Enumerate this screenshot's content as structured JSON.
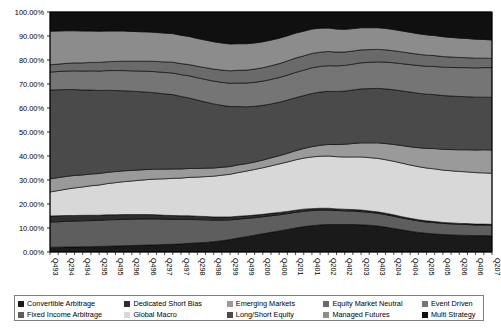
{
  "chart_data": {
    "type": "area",
    "stacked": true,
    "normalized_percent": true,
    "title": "",
    "xlabel": "",
    "ylabel": "",
    "ylim": [
      0,
      100
    ],
    "ytick_labels": [
      "0.00%",
      "10.00%",
      "20.00%",
      "30.00%",
      "40.00%",
      "50.00%",
      "60.00%",
      "70.00%",
      "80.00%",
      "90.00%",
      "100.00%"
    ],
    "ytick_values": [
      0,
      10,
      20,
      30,
      40,
      50,
      60,
      70,
      80,
      90,
      100
    ],
    "grid": false,
    "legend_position": "bottom",
    "x_tick_labels": [
      "Q493",
      "Q294",
      "Q494",
      "Q295",
      "Q495",
      "Q296",
      "Q496",
      "Q297",
      "Q497",
      "Q298",
      "Q498",
      "Q299",
      "Q499",
      "Q200",
      "Q400",
      "Q201",
      "Q401",
      "Q202",
      "Q402",
      "Q203",
      "Q403",
      "Q204",
      "Q404",
      "Q205",
      "Q405",
      "Q206",
      "Q406",
      "Q207"
    ],
    "x": [
      "Q493",
      "Q194",
      "Q294",
      "Q394",
      "Q494",
      "Q195",
      "Q295",
      "Q395",
      "Q495",
      "Q196",
      "Q296",
      "Q396",
      "Q496",
      "Q197",
      "Q297",
      "Q397",
      "Q497",
      "Q198",
      "Q298",
      "Q398",
      "Q498",
      "Q199",
      "Q299",
      "Q399",
      "Q499",
      "Q100",
      "Q200",
      "Q300",
      "Q400",
      "Q101",
      "Q201",
      "Q301",
      "Q401",
      "Q102",
      "Q202",
      "Q302",
      "Q402",
      "Q103",
      "Q203",
      "Q303",
      "Q403",
      "Q104",
      "Q204",
      "Q304",
      "Q404",
      "Q105",
      "Q205",
      "Q305",
      "Q405",
      "Q106",
      "Q206",
      "Q306",
      "Q406",
      "Q107",
      "Q207"
    ],
    "series": [
      {
        "name": "Convertible Arbitrage",
        "color": "#1a1a1a",
        "values": [
          2.0,
          2.0,
          2.1,
          2.1,
          2.2,
          2.2,
          2.3,
          2.4,
          2.5,
          2.6,
          2.7,
          2.8,
          2.9,
          3.0,
          3.1,
          3.2,
          3.4,
          3.6,
          3.8,
          4.0,
          4.3,
          4.7,
          5.2,
          5.8,
          6.4,
          7.0,
          7.6,
          8.2,
          8.8,
          9.4,
          10.0,
          10.6,
          11.0,
          11.4,
          11.7,
          11.8,
          11.9,
          11.9,
          11.8,
          11.6,
          11.3,
          10.8,
          10.2,
          9.6,
          9.0,
          8.5,
          8.1,
          7.8,
          7.6,
          7.4,
          7.3,
          7.2,
          7.1,
          7.1,
          7.0
        ]
      },
      {
        "name": "Fixed Income Arbitrage",
        "color": "#5e5e5e",
        "values": [
          10.5,
          10.6,
          10.7,
          10.8,
          10.8,
          10.9,
          10.9,
          11.0,
          11.0,
          11.0,
          11.0,
          11.0,
          10.9,
          10.8,
          10.6,
          10.4,
          10.2,
          10.0,
          9.7,
          9.4,
          9.0,
          8.6,
          8.2,
          7.9,
          7.6,
          7.3,
          7.1,
          6.9,
          6.7,
          6.6,
          6.5,
          6.4,
          6.3,
          6.2,
          6.1,
          6.0,
          5.9,
          5.8,
          5.7,
          5.6,
          5.5,
          5.4,
          5.3,
          5.2,
          5.1,
          5.0,
          4.9,
          4.9,
          4.8,
          4.8,
          4.7,
          4.7,
          4.6,
          4.6,
          4.6
        ]
      },
      {
        "name": "Dedicated Short Bias",
        "color": "#2e2e2e",
        "values": [
          2.5,
          2.5,
          2.4,
          2.3,
          2.3,
          2.2,
          2.1,
          2.1,
          2.0,
          2.0,
          1.9,
          1.8,
          1.8,
          1.7,
          1.6,
          1.6,
          1.5,
          1.5,
          1.4,
          1.4,
          1.3,
          1.3,
          1.2,
          1.2,
          1.1,
          1.1,
          1.0,
          1.0,
          1.0,
          0.9,
          0.9,
          0.9,
          0.8,
          0.8,
          0.8,
          0.7,
          0.7,
          0.7,
          0.7,
          0.6,
          0.6,
          0.6,
          0.6,
          0.5,
          0.5,
          0.5,
          0.5,
          0.5,
          0.4,
          0.4,
          0.4,
          0.4,
          0.4,
          0.4,
          0.4
        ]
      },
      {
        "name": "Global Macro",
        "color": "#d8d8d8",
        "values": [
          10.0,
          10.5,
          11.0,
          11.5,
          11.8,
          12.3,
          12.6,
          13.0,
          13.4,
          13.7,
          14.0,
          14.3,
          14.6,
          14.9,
          15.2,
          15.5,
          15.7,
          16.0,
          16.3,
          16.6,
          17.0,
          17.4,
          17.8,
          18.2,
          18.6,
          19.0,
          19.4,
          19.8,
          20.2,
          20.6,
          21.0,
          21.3,
          21.6,
          21.9,
          22.2,
          22.4,
          22.6,
          22.8,
          23.0,
          23.1,
          23.2,
          23.2,
          23.2,
          23.2,
          23.1,
          23.0,
          22.9,
          22.8,
          22.7,
          22.6,
          22.5,
          22.4,
          22.3,
          22.2,
          22.1
        ]
      },
      {
        "name": "Emerging Markets",
        "color": "#9a9a9a",
        "values": [
          5.5,
          5.4,
          5.3,
          5.2,
          5.0,
          4.9,
          4.8,
          4.7,
          4.6,
          4.5,
          4.4,
          4.3,
          4.2,
          4.1,
          4.0,
          3.9,
          3.8,
          3.7,
          3.6,
          3.5,
          3.4,
          3.3,
          3.2,
          3.2,
          3.1,
          3.1,
          3.2,
          3.3,
          3.4,
          3.6,
          3.8,
          4.0,
          4.3,
          4.6,
          4.9,
          5.2,
          5.5,
          5.8,
          6.1,
          6.4,
          6.7,
          7.0,
          7.3,
          7.6,
          7.9,
          8.2,
          8.5,
          8.8,
          9.0,
          9.2,
          9.4,
          9.6,
          9.8,
          10.0,
          10.1
        ]
      },
      {
        "name": "Long/Short Equity",
        "color": "#4a4a4a",
        "values": [
          37.0,
          36.6,
          36.2,
          35.8,
          35.4,
          35.0,
          34.6,
          34.2,
          33.8,
          33.4,
          33.0,
          32.6,
          32.2,
          31.8,
          31.4,
          31.0,
          30.2,
          29.4,
          28.5,
          27.6,
          26.7,
          25.8,
          25.0,
          24.3,
          23.7,
          23.2,
          22.8,
          22.5,
          22.3,
          22.2,
          22.1,
          22.1,
          22.2,
          22.4,
          22.6,
          22.8,
          23.0,
          23.2,
          23.4,
          23.5,
          23.6,
          23.7,
          23.7,
          23.7,
          23.7,
          23.6,
          23.5,
          23.4,
          23.3,
          23.2,
          23.1,
          23.0,
          22.9,
          22.8,
          22.8
        ]
      },
      {
        "name": "Event Driven",
        "color": "#757575",
        "values": [
          7.5,
          7.6,
          7.7,
          7.8,
          7.9,
          8.0,
          8.1,
          8.2,
          8.3,
          8.4,
          8.5,
          8.6,
          8.7,
          8.8,
          8.9,
          9.0,
          9.1,
          9.2,
          9.3,
          9.4,
          9.5,
          9.6,
          9.7,
          9.8,
          9.9,
          10.0,
          10.1,
          10.2,
          10.3,
          10.4,
          10.5,
          10.6,
          10.7,
          10.8,
          10.9,
          11.0,
          11.1,
          11.2,
          11.3,
          11.4,
          11.5,
          11.6,
          11.7,
          11.8,
          11.9,
          12.0,
          12.1,
          12.2,
          12.3,
          12.4,
          12.5,
          12.6,
          12.7,
          12.8,
          12.9
        ]
      },
      {
        "name": "Equity Market Neutral",
        "color": "#6a6a6a",
        "values": [
          3.0,
          3.1,
          3.2,
          3.3,
          3.4,
          3.5,
          3.6,
          3.7,
          3.8,
          3.9,
          4.0,
          4.1,
          4.2,
          4.3,
          4.4,
          4.5,
          4.6,
          4.7,
          4.8,
          4.9,
          5.0,
          5.1,
          5.2,
          5.3,
          5.4,
          5.5,
          5.6,
          5.7,
          5.8,
          5.9,
          6.0,
          6.0,
          6.0,
          6.0,
          6.0,
          5.9,
          5.8,
          5.7,
          5.6,
          5.5,
          5.4,
          5.3,
          5.2,
          5.1,
          5.0,
          4.9,
          4.8,
          4.7,
          4.6,
          4.5,
          4.4,
          4.3,
          4.2,
          4.1,
          4.0
        ]
      },
      {
        "name": "Managed Futures",
        "color": "#8c8c8c",
        "values": [
          14.0,
          13.8,
          13.6,
          13.4,
          13.3,
          13.1,
          13.0,
          12.8,
          12.7,
          12.6,
          12.4,
          12.3,
          12.2,
          12.1,
          12.0,
          11.9,
          11.8,
          11.7,
          11.6,
          11.5,
          11.4,
          11.3,
          11.2,
          11.1,
          11.0,
          10.9,
          10.8,
          10.7,
          10.6,
          10.5,
          10.4,
          10.3,
          10.2,
          10.1,
          10.0,
          9.9,
          9.8,
          9.7,
          9.6,
          9.5,
          9.4,
          9.3,
          9.2,
          9.1,
          9.0,
          8.9,
          8.8,
          8.7,
          8.6,
          8.5,
          8.4,
          8.3,
          8.2,
          8.1,
          8.0
        ]
      },
      {
        "name": "Multi Strategy",
        "color": "#101010",
        "values": [
          8.0,
          7.9,
          7.8,
          7.8,
          7.9,
          7.9,
          8.0,
          7.9,
          7.9,
          7.9,
          8.1,
          8.2,
          8.3,
          8.5,
          8.8,
          9.0,
          9.7,
          10.2,
          11.0,
          11.7,
          12.4,
          12.9,
          13.3,
          13.2,
          13.2,
          12.9,
          12.4,
          11.7,
          10.9,
          9.9,
          8.8,
          8.0,
          7.1,
          6.8,
          6.8,
          7.3,
          7.5,
          7.2,
          6.8,
          6.8,
          6.8,
          7.1,
          7.6,
          8.2,
          8.8,
          9.4,
          9.9,
          10.2,
          10.7,
          11.0,
          11.3,
          11.5,
          11.8,
          11.9,
          12.1
        ]
      }
    ]
  },
  "legend": {
    "row1": [
      {
        "label": "Convertible Arbitrage",
        "color": "#1a1a1a"
      },
      {
        "label": "Dedicated Short Bias",
        "color": "#2e2e2e"
      },
      {
        "label": "Emerging Markets",
        "color": "#9a9a9a"
      },
      {
        "label": "Equity Market Neutral",
        "color": "#6a6a6a"
      },
      {
        "label": "Event Driven",
        "color": "#757575"
      }
    ],
    "row2": [
      {
        "label": "Fixed Income Arbitrage",
        "color": "#5e5e5e"
      },
      {
        "label": "Global Macro",
        "color": "#d8d8d8"
      },
      {
        "label": "Long/Short Equity",
        "color": "#4a4a4a"
      },
      {
        "label": "Managed Futures",
        "color": "#8c8c8c"
      },
      {
        "label": "Multi Strategy",
        "color": "#101010"
      }
    ]
  },
  "axes": {
    "border_color": "#000000",
    "plot_background": "#ffffff"
  }
}
